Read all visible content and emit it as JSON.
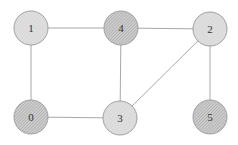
{
  "diagram": {
    "type": "undirected-graph",
    "colors": {
      "background": "#ffffff",
      "edge": "#a8a8a8",
      "node_stroke": "#a0a0a0",
      "light_fill": "#dedede",
      "light_hatch": "#cfcfcf",
      "dark_fill": "#cdcdcd",
      "dark_hatch": "#9c9c9c",
      "label": "#333333"
    },
    "node_radius": 17,
    "nodes": [
      {
        "id": "1",
        "label": "1",
        "x": 31,
        "y": 28,
        "style": "light"
      },
      {
        "id": "4",
        "label": "4",
        "x": 121,
        "y": 28,
        "style": "dark"
      },
      {
        "id": "2",
        "label": "2",
        "x": 210,
        "y": 29,
        "style": "light"
      },
      {
        "id": "0",
        "label": "0",
        "x": 31,
        "y": 117,
        "style": "dark"
      },
      {
        "id": "3",
        "label": "3",
        "x": 120,
        "y": 118,
        "style": "light"
      },
      {
        "id": "5",
        "label": "5",
        "x": 210,
        "y": 117,
        "style": "dark"
      }
    ],
    "edges": [
      {
        "from": "1",
        "to": "4"
      },
      {
        "from": "1",
        "to": "0"
      },
      {
        "from": "4",
        "to": "2"
      },
      {
        "from": "4",
        "to": "3"
      },
      {
        "from": "2",
        "to": "3"
      },
      {
        "from": "2",
        "to": "5"
      },
      {
        "from": "0",
        "to": "3"
      }
    ]
  }
}
